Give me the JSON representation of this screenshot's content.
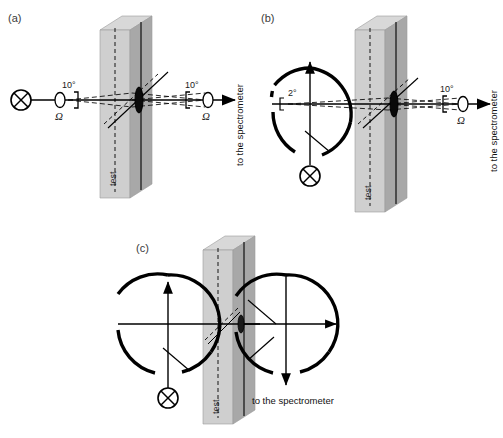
{
  "figure": {
    "type": "scientific-diagram"
  },
  "panels": [
    {
      "id": "a",
      "label": "(a)",
      "angle_left": "10°",
      "angle_right": "10°",
      "omega_left": "Ω",
      "omega_right": "Ω",
      "sample_label": "test",
      "spectrometer_label": "to the spectrometer",
      "has_deflector_circles": 0
    },
    {
      "id": "b",
      "label": "(b)",
      "angle_left": "2°",
      "angle_right": "10°",
      "omega_right": "Ω",
      "sample_label": "test",
      "spectrometer_label": "to the spectrometer",
      "has_deflector_circles": 1
    },
    {
      "id": "c",
      "label": "(c)",
      "sample_label": "test",
      "spectrometer_label": "to the spectrometer",
      "has_deflector_circles": 2
    }
  ],
  "colors": {
    "slab_face": "#a8a8a8",
    "slab_edge_top": "#d6d6d6",
    "slab_edge_side": "#c9c9c9",
    "line": "#000000",
    "panel_label": "#3a3a3a",
    "background": "#ffffff"
  },
  "icons": {
    "source": "crossed-circle-source-icon",
    "aperture": "aperture-icon",
    "lens": "lens-icon",
    "arrow": "arrow-icon"
  }
}
